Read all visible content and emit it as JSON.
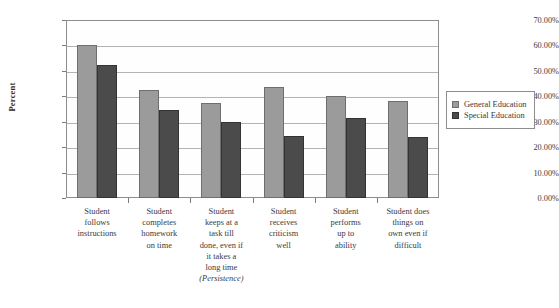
{
  "chart_data": {
    "type": "bar",
    "title": "",
    "xlabel": "",
    "ylabel": "Percent",
    "ylim": [
      0,
      70
    ],
    "ytick_labels": [
      "70.00%",
      "60.00%",
      "50.00%",
      "40.00%",
      "30.00%",
      "20.00%",
      "10.00%",
      "0.00%"
    ],
    "ytick_values": [
      70,
      60,
      50,
      40,
      30,
      20,
      10,
      0
    ],
    "grid": true,
    "legend_position": "right",
    "categories": [
      "Student follows instructions",
      "Student completes homework on time",
      "Student keeps at a task till done, even if it takes a long time (Persistence)",
      "Student receives criticism well",
      "Student performs up to ability",
      "Student does things on own even if difficult"
    ],
    "category_lines": [
      [
        "Student",
        "follows",
        "instructions"
      ],
      [
        "Student",
        "completes",
        "homework",
        "on time"
      ],
      [
        "Student",
        "keeps at a",
        "task till",
        "done, even if",
        "it takes a",
        "long time",
        "(Persistence)"
      ],
      [
        "Student",
        "receives",
        "criticism",
        "well"
      ],
      [
        "Student",
        "performs",
        "up to",
        "ability"
      ],
      [
        "Student does",
        "things on",
        "own even if",
        "difficult"
      ]
    ],
    "series": [
      {
        "name": "General Education",
        "color": "#9b9b9b",
        "values": [
          60.0,
          42.5,
          37.5,
          43.5,
          40.0,
          38.0
        ]
      },
      {
        "name": "Special Education",
        "color": "#4b4b4b",
        "values": [
          52.5,
          34.5,
          30.0,
          24.5,
          31.5,
          24.0
        ]
      }
    ]
  },
  "legend": {
    "items": [
      {
        "label": "General Education",
        "color": "#9b9b9b"
      },
      {
        "label": "Special Education",
        "color": "#4b4b4b"
      }
    ]
  },
  "axis": {
    "y_title": "Percent"
  }
}
